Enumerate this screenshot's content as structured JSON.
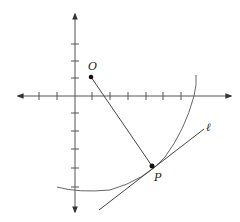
{
  "figure": {
    "labels": {
      "O": "O",
      "P": "P",
      "line": "ℓ"
    },
    "axes": {
      "origin_px": [
        75,
        96
      ],
      "x_tick_count_left": 2,
      "x_tick_count_right": 6,
      "y_tick_count_up": 3,
      "y_tick_count_down": 5
    },
    "points": {
      "O": {
        "px": [
          91,
          77
        ]
      },
      "P": {
        "px": [
          152,
          166
        ]
      }
    },
    "colors": {
      "axis": "#555555",
      "curve": "#666666",
      "segment": "#444444",
      "point": "#111111"
    }
  }
}
